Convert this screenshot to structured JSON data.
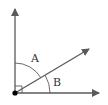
{
  "diagram": {
    "type": "angle-diagram",
    "labels": {
      "angle_a": "A",
      "angle_b": "B"
    },
    "colors": {
      "line": "#5a5a5a",
      "point": "#000000",
      "text": "#333333"
    }
  }
}
